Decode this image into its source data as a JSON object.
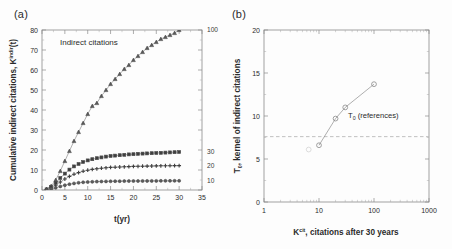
{
  "figure": {
    "background": "#fdfdfd",
    "panel_a_label": "(a)",
    "panel_b_label": "(b)"
  },
  "panel_a": {
    "in_plot_annotation": "Indirect citations",
    "xlabel": "t(yr)",
    "ylabel_main": "Cumulative indirect citations, K",
    "ylabel_sup": "indir",
    "ylabel_tail": "(t)",
    "xticks": [
      "0",
      "5",
      "10",
      "15",
      "20",
      "25",
      "30",
      "35"
    ],
    "yticks": [
      "0",
      "10",
      "20",
      "30",
      "40",
      "50",
      "60",
      "70",
      "80"
    ],
    "curve_labels": [
      "100",
      "30",
      "20",
      "10"
    ]
  },
  "panel_b": {
    "xlabel_main": "K",
    "xlabel_sup": "cit",
    "xlabel_tail": ", citations after 30 years",
    "ylabel_main": "T",
    "ylabel_sub": "0",
    "ylabel_tail": ", kernel of indirect citations",
    "xticks": [
      "1",
      "10",
      "100",
      "1000"
    ],
    "yticks": [
      "0",
      "5",
      "10",
      "15",
      "20"
    ],
    "reference_annotation_main": "T",
    "reference_annotation_sub": "0",
    "reference_annotation_tail": " (references)"
  },
  "chart_data": [
    {
      "type": "line",
      "panel": "a",
      "title": "Indirect citations",
      "xlabel": "t(yr)",
      "ylabel": "Cumulative indirect citations, K^indir(t)",
      "xlim": [
        0,
        35
      ],
      "ylim": [
        0,
        80
      ],
      "xticks": [
        0,
        5,
        10,
        15,
        20,
        25,
        30,
        35
      ],
      "yticks": [
        0,
        10,
        20,
        30,
        40,
        50,
        60,
        70,
        80
      ],
      "grid": false,
      "legend": "curve-end labels at right",
      "series": [
        {
          "name": "100",
          "marker": "triangle",
          "label_position_y": 80,
          "x": [
            1,
            2,
            3,
            4,
            5,
            6,
            7,
            8,
            9,
            10,
            11,
            12,
            13,
            14,
            15,
            16,
            17,
            18,
            19,
            20,
            21,
            22,
            23,
            24,
            25,
            26,
            27,
            28,
            29,
            30
          ],
          "y": [
            0.5,
            2.0,
            5.0,
            9.5,
            14.5,
            19.5,
            24.5,
            29.0,
            33.5,
            38.0,
            42.0,
            43.5,
            47.0,
            50.0,
            53.0,
            55.5,
            58.0,
            60.5,
            62.5,
            65.0,
            67.0,
            69.0,
            71.0,
            72.5,
            74.0,
            75.5,
            76.5,
            77.5,
            78.5,
            80.0
          ]
        },
        {
          "name": "30",
          "marker": "square",
          "label_position_y": 19,
          "x": [
            1,
            2,
            3,
            4,
            5,
            6,
            7,
            8,
            9,
            10,
            11,
            12,
            13,
            14,
            15,
            16,
            17,
            18,
            19,
            20,
            21,
            22,
            23,
            24,
            25,
            26,
            27,
            28,
            29,
            30
          ],
          "y": [
            0.3,
            1.5,
            3.6,
            6.0,
            8.2,
            10.2,
            11.8,
            13.0,
            14.0,
            14.8,
            15.4,
            15.9,
            16.3,
            16.7,
            17.0,
            17.2,
            17.4,
            17.6,
            17.8,
            17.9,
            18.1,
            18.2,
            18.3,
            18.4,
            18.5,
            18.6,
            18.7,
            18.8,
            18.9,
            19.0
          ]
        },
        {
          "name": "20",
          "marker": "plus",
          "label_position_y": 12.2,
          "x": [
            1,
            2,
            3,
            4,
            5,
            6,
            7,
            8,
            9,
            10,
            11,
            12,
            13,
            14,
            15,
            16,
            17,
            18,
            19,
            20,
            21,
            22,
            23,
            24,
            25,
            26,
            27,
            28,
            29,
            30
          ],
          "y": [
            0.2,
            1.0,
            2.4,
            4.0,
            5.5,
            6.8,
            7.9,
            8.7,
            9.4,
            9.9,
            10.3,
            10.6,
            10.9,
            11.1,
            11.3,
            11.4,
            11.5,
            11.6,
            11.7,
            11.8,
            11.85,
            11.9,
            11.95,
            12.0,
            12.05,
            12.1,
            12.12,
            12.15,
            12.18,
            12.2
          ]
        },
        {
          "name": "10",
          "marker": "circle",
          "label_position_y": 4.6,
          "x": [
            1,
            2,
            3,
            4,
            5,
            6,
            7,
            8,
            9,
            10,
            11,
            12,
            13,
            14,
            15,
            16,
            17,
            18,
            19,
            20,
            21,
            22,
            23,
            24,
            25,
            26,
            27,
            28,
            29,
            30
          ],
          "y": [
            0.1,
            0.5,
            1.1,
            1.8,
            2.4,
            2.9,
            3.3,
            3.6,
            3.85,
            4.0,
            4.1,
            4.2,
            4.25,
            4.3,
            4.35,
            4.4,
            4.42,
            4.45,
            4.47,
            4.5,
            4.5,
            4.52,
            4.54,
            4.55,
            4.56,
            4.57,
            4.58,
            4.59,
            4.6,
            4.6
          ]
        }
      ]
    },
    {
      "type": "scatter",
      "panel": "b",
      "xlabel": "K^cit, citations after 30 years",
      "ylabel": "T_0, kernel of indirect citations",
      "xscale": "log",
      "xlim": [
        1,
        1000
      ],
      "ylim": [
        0,
        20
      ],
      "xticks": [
        1,
        10,
        100,
        1000
      ],
      "yticks": [
        0,
        5,
        10,
        15,
        20
      ],
      "grid": false,
      "marker": "open-circle",
      "reference_line_y": 7.6,
      "reference_line_style": "dashed",
      "x": [
        6.5,
        10,
        20,
        30,
        100
      ],
      "y": [
        6.1,
        6.6,
        9.7,
        11.0,
        13.7
      ],
      "faint_first_point": true
    }
  ]
}
